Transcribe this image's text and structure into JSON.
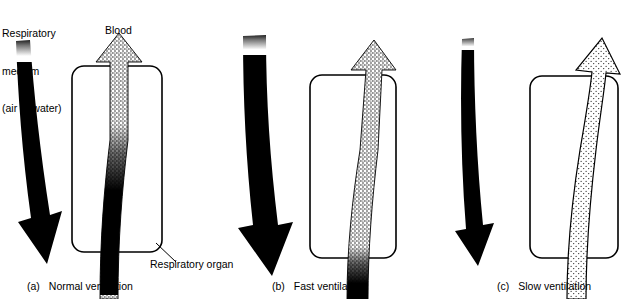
{
  "figure": {
    "background_color": "#ffffff",
    "ink_color": "#000000"
  },
  "labels": {
    "medium": {
      "line1": "Respiratory",
      "line2": "medium",
      "line3": "(air or water)"
    },
    "blood": "Blood",
    "organ": "Respiratory organ"
  },
  "captions": [
    {
      "tag": "(a)",
      "text": "Normal ventilation"
    },
    {
      "tag": "(b)",
      "text": "Fast ventilation"
    },
    {
      "tag": "(c)",
      "text": "Slow ventilation"
    }
  ],
  "panels": [
    {
      "id": "a",
      "caption_tag": "(a)",
      "caption_text": "Normal ventilation",
      "medium_flow": "normal",
      "medium_arrow_direction": "down",
      "medium_arrow_width_px": 20,
      "medium_arrow_fill": "solid-black",
      "blood_arrow_direction": "up",
      "blood_arrow_fill": "gradient-stipple-to-black",
      "oxygenation": "partial",
      "oxygenation_transition_height_fraction": 0.45
    },
    {
      "id": "b",
      "caption_tag": "(b)",
      "caption_text": "Fast ventilation",
      "medium_flow": "fast",
      "medium_arrow_direction": "down",
      "medium_arrow_width_px": 28,
      "medium_arrow_fill": "solid-black",
      "blood_arrow_direction": "up",
      "blood_arrow_fill": "gradient-stipple-to-black",
      "oxygenation": "high",
      "oxygenation_transition_height_fraction": 0.12
    },
    {
      "id": "c",
      "caption_tag": "(c)",
      "caption_text": "Slow ventilation",
      "medium_flow": "slow",
      "medium_arrow_direction": "down",
      "medium_arrow_width_px": 8,
      "medium_arrow_fill": "solid-black",
      "blood_arrow_direction": "up",
      "blood_arrow_fill": "stipple-outlined",
      "oxygenation": "low",
      "oxygenation_transition_height_fraction": 1.0
    }
  ]
}
